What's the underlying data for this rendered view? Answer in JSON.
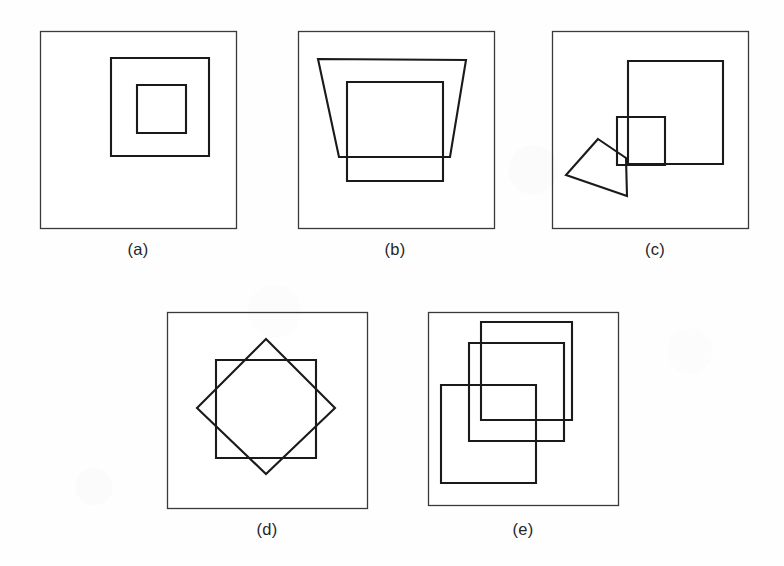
{
  "figure": {
    "background_color": "#fefefe",
    "frame_color": "#3a3a3a",
    "shape_color": "#1a1a1a",
    "panel_count": 5
  },
  "panels": [
    {
      "id": "a",
      "caption": "(a)",
      "caption_x": 138,
      "caption_y": 240,
      "frame": {
        "x": 40,
        "y": 31,
        "w": 196,
        "h": 197
      },
      "description": "three concentric nested squares",
      "shapes": [
        {
          "name": "middle-square",
          "kind": "square",
          "points": "111,58 209,58 209,156 111,156"
        },
        {
          "name": "inner-square",
          "kind": "square",
          "points": "137,85 186,85 186,133 137,133"
        }
      ]
    },
    {
      "id": "b",
      "caption": "(b)",
      "caption_x": 395,
      "caption_y": 240,
      "frame": {
        "x": 298,
        "y": 31,
        "w": 196,
        "h": 197
      },
      "description": "a trapezoid overlapping a square",
      "shapes": [
        {
          "name": "trapezoid",
          "kind": "trapezoid",
          "points": "318,59 466,60 450,157 339,157"
        },
        {
          "name": "square",
          "kind": "square",
          "points": "347,82 443,82 443,181 347,181"
        }
      ]
    },
    {
      "id": "c",
      "caption": "(c)",
      "caption_x": 655,
      "caption_y": 240,
      "frame": {
        "x": 552,
        "y": 31,
        "w": 196,
        "h": 197
      },
      "description": "a large square, a small square and an irregular quadrilateral, all mutually overlapping",
      "shapes": [
        {
          "name": "large-square",
          "kind": "square",
          "points": "628,61 723,61 723,164 628,164"
        },
        {
          "name": "small-square",
          "kind": "square",
          "points": "617,117 665,117 665,165 617,165"
        },
        {
          "name": "quadrilateral",
          "kind": "quadrilateral",
          "points": "598,139 626,158 627,196 566,175"
        }
      ]
    },
    {
      "id": "d",
      "caption": "(d)",
      "caption_x": 267,
      "caption_y": 520,
      "frame": {
        "x": 167,
        "y": 312,
        "w": 200,
        "h": 196
      },
      "description": "an axis-aligned square overlapping a 45-degree rotated square, forming an eight-pointed star",
      "shapes": [
        {
          "name": "upright-square",
          "kind": "square",
          "points": "216,360 316,360 316,458 216,458"
        },
        {
          "name": "rotated-square",
          "kind": "diamond",
          "points": "266,339 335,408 266,474 197,408"
        }
      ]
    },
    {
      "id": "e",
      "caption": "(e)",
      "caption_x": 523,
      "caption_y": 520,
      "frame": {
        "x": 428,
        "y": 312,
        "w": 190,
        "h": 193
      },
      "description": "three equal squares overlapping in a descending staircase arrangement",
      "shapes": [
        {
          "name": "square-top-right",
          "kind": "square",
          "points": "481,322 572,322 572,420 481,420"
        },
        {
          "name": "square-middle",
          "kind": "square",
          "points": "469,343 564,343 564,441 469,441"
        },
        {
          "name": "square-bottom-left",
          "kind": "square",
          "points": "441,385 536,385 536,483 441,483"
        }
      ]
    }
  ]
}
